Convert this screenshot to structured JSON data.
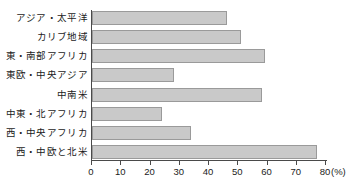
{
  "chart_data": {
    "type": "bar",
    "orientation": "horizontal",
    "title": "",
    "xlabel": "(%)",
    "ylabel": "",
    "xlim": [
      0,
      80
    ],
    "xticks": [
      0,
      10,
      20,
      30,
      40,
      50,
      60,
      70,
      80
    ],
    "grid": false,
    "legend": null,
    "unit": "(%)",
    "categories": [
      "アジア・太平洋",
      "カリブ地域",
      "東・南部アフリカ",
      "東欧・中央アジア",
      "中南米",
      "中東・北アフリカ",
      "西・中央アフリカ",
      "西・中欧と北米"
    ],
    "values": [
      46,
      51,
      59,
      28,
      58,
      24,
      34,
      77
    ],
    "bar_color": "#c9c9c9",
    "bar_border_color": "#9a9a9a",
    "axis_color": "#4a4a4a"
  }
}
